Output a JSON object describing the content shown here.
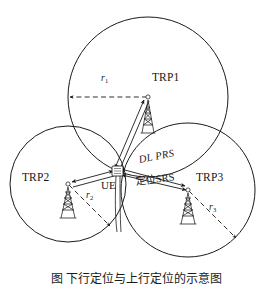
{
  "figure": {
    "type": "network-positioning-diagram",
    "caption": "图   下行定位与上行定位的示意图",
    "background_color": "#ffffff",
    "line_color": "#1a1a1a"
  },
  "nodes": [
    {
      "id": "trp1",
      "label": "TRP1",
      "icon": "cell-tower-icon",
      "center": {
        "x": 148,
        "y": 97
      },
      "radius": 80,
      "radius_label": "r",
      "radius_subscript": "1",
      "label_pos": {
        "x": 152,
        "y": 80
      },
      "tower_pos": {
        "x": 148,
        "y": 97
      }
    },
    {
      "id": "trp2",
      "label": "TRP2",
      "icon": "cell-tower-icon",
      "center": {
        "x": 68,
        "y": 184
      },
      "radius": 58,
      "radius_label": "r",
      "radius_subscript": "2",
      "label_pos": {
        "x": 24,
        "y": 178
      },
      "tower_pos": {
        "x": 68,
        "y": 184
      }
    },
    {
      "id": "trp3",
      "label": "TRP3",
      "icon": "cell-tower-icon",
      "center": {
        "x": 188,
        "y": 190
      },
      "radius": 67,
      "radius_label": "r",
      "radius_subscript": "3",
      "label_pos": {
        "x": 196,
        "y": 178
      },
      "tower_pos": {
        "x": 188,
        "y": 190
      }
    }
  ],
  "ue": {
    "id": "ue",
    "label": "UE",
    "icon": "ue-device-icon",
    "pos": {
      "x": 117,
      "y": 170
    },
    "label_pos": {
      "x": 103,
      "y": 182
    }
  },
  "signals": [
    {
      "id": "dl-prs",
      "label": "DL_PRS",
      "label_display": "DL  PRS",
      "direction": "bidirectional",
      "from": "ue",
      "to": "trp3",
      "label_pos": {
        "x": 143,
        "y": 160
      },
      "rotation_deg": -11
    },
    {
      "id": "srs-positioning",
      "label": "定位SRS",
      "direction": "bidirectional",
      "from": "ue",
      "to": "trp3",
      "label_pos": {
        "x": 140,
        "y": 180
      },
      "rotation_deg": -8
    }
  ],
  "radius_arrows": [
    {
      "id": "r1-arrow",
      "node": "trp1",
      "style": "dashed",
      "label": "r",
      "subscript": "1",
      "label_pos": {
        "x": 102,
        "y": 78
      }
    },
    {
      "id": "r2-arrow",
      "node": "trp2",
      "style": "dashed",
      "label": "r",
      "subscript": "2",
      "label_pos": {
        "x": 88,
        "y": 194
      }
    },
    {
      "id": "r3-arrow",
      "node": "trp3",
      "style": "dashed",
      "label": "r",
      "subscript": "3",
      "label_pos": {
        "x": 228,
        "y": 204
      }
    }
  ],
  "links": [
    {
      "id": "ue-trp1-link",
      "from": "ue",
      "to": "trp1",
      "direction": "bidirectional"
    },
    {
      "id": "ue-trp2-link",
      "from": "ue",
      "to": "trp2",
      "direction": "bidirectional"
    },
    {
      "id": "ue-trp3-link",
      "from": "ue",
      "to": "trp3",
      "direction": "bidirectional"
    }
  ]
}
